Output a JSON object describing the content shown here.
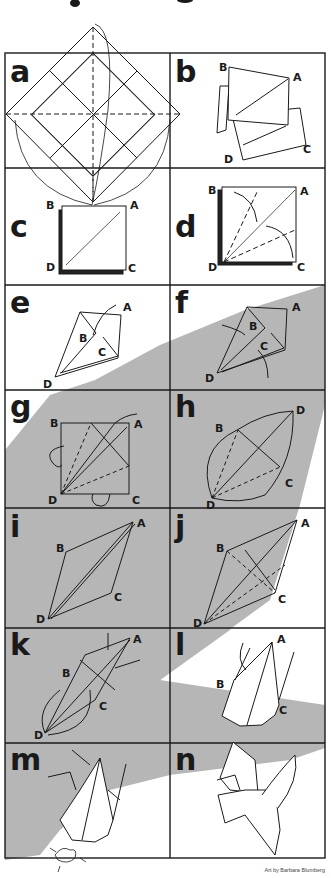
{
  "figure": {
    "credit": "Art by Barbara Blumberg",
    "colors": {
      "line": "#1a1a1a",
      "shadow": "#b4b4b4",
      "background": "#ffffff"
    },
    "panels": [
      {
        "id": "a",
        "label": "a",
        "vertices": []
      },
      {
        "id": "b",
        "label": "b",
        "vertices": [
          "B",
          "A",
          "C",
          "D"
        ]
      },
      {
        "id": "c",
        "label": "c",
        "vertices": [
          "B",
          "A",
          "D",
          "C"
        ]
      },
      {
        "id": "d",
        "label": "d",
        "vertices": [
          "B",
          "A",
          "D",
          "C"
        ]
      },
      {
        "id": "e",
        "label": "e",
        "vertices": [
          "A",
          "B",
          "C",
          "D"
        ]
      },
      {
        "id": "f",
        "label": "f",
        "vertices": [
          "A",
          "B",
          "C",
          "D"
        ]
      },
      {
        "id": "g",
        "label": "g",
        "vertices": [
          "B",
          "A",
          "D",
          "C"
        ]
      },
      {
        "id": "h",
        "label": "h",
        "vertices": [
          "D",
          "B",
          "C",
          "D"
        ]
      },
      {
        "id": "i",
        "label": "i",
        "vertices": [
          "A",
          "B",
          "C",
          "D"
        ]
      },
      {
        "id": "j",
        "label": "j",
        "vertices": [
          "A",
          "B",
          "C",
          "D"
        ]
      },
      {
        "id": "k",
        "label": "k",
        "vertices": [
          "A",
          "B",
          "C",
          "D"
        ]
      },
      {
        "id": "l",
        "label": "l",
        "vertices": [
          "A",
          "B",
          "C"
        ]
      },
      {
        "id": "m",
        "label": "m",
        "vertices": []
      },
      {
        "id": "n",
        "label": "n",
        "vertices": []
      }
    ]
  }
}
